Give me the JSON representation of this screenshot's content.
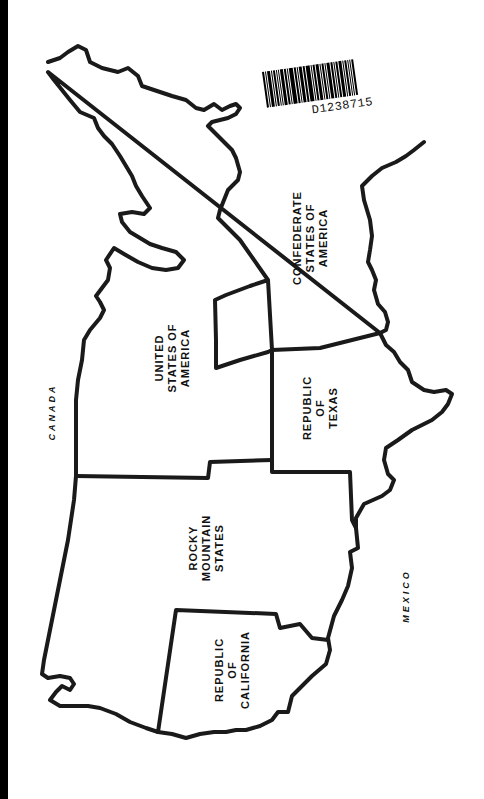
{
  "map": {
    "orientation": "rotated 90 degrees counter-clockwise (north at left)",
    "colors": {
      "background": "#ffffff",
      "outline": "#1a1a1a",
      "text": "#111111",
      "edge_strip": "#000000"
    },
    "regions": [
      {
        "id": "usa",
        "lines": [
          "UNITED",
          "STATES OF",
          "AMERICA"
        ]
      },
      {
        "id": "csa",
        "lines": [
          "CONFEDERATE",
          "STATES OF",
          "AMERICA"
        ]
      },
      {
        "id": "texas",
        "lines": [
          "REPUBLIC",
          "OF",
          "TEXAS"
        ]
      },
      {
        "id": "rocky",
        "lines": [
          "ROCKY",
          "MOUNTAIN",
          "STATES"
        ]
      },
      {
        "id": "california",
        "lines": [
          "REPUBLIC",
          "OF",
          "CALIFORNIA"
        ]
      }
    ],
    "neighbors": [
      {
        "id": "canada",
        "label": "CANADA"
      },
      {
        "id": "mexico",
        "label": "MEXICO"
      }
    ]
  },
  "barcode": {
    "code": "D1238715"
  }
}
